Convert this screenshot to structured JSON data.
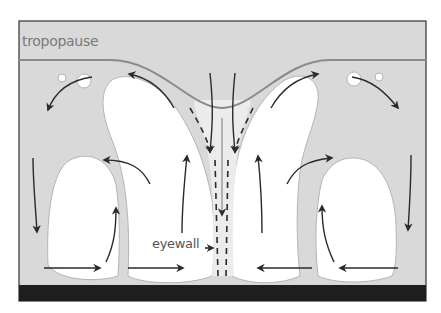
{
  "diagram": {
    "labels": {
      "tropopause": "tropopause",
      "eyewall": "eyewall"
    },
    "colors": {
      "background": "#d9d9d9",
      "cloud": "#ffffff",
      "tropopause_line": "#8a8a8a",
      "arrow": "#2a2a2a",
      "ground": "#1e1e1e",
      "frame": "#333333"
    },
    "elements": [
      {
        "name": "tropopause-line",
        "description": "curved line dipping down over eye"
      },
      {
        "name": "outer-left-cell",
        "description": "closed cloud cell with rising arrow"
      },
      {
        "name": "inner-left-cell",
        "description": "tall eyewall cloud tilted outward"
      },
      {
        "name": "inner-right-cell",
        "description": "tall eyewall cloud tilted outward"
      },
      {
        "name": "outer-right-cell",
        "description": "closed cloud cell with rising arrow"
      },
      {
        "name": "eye",
        "description": "central descending air, dashed arrows"
      },
      {
        "name": "ground",
        "description": "black surface bar"
      }
    ]
  }
}
